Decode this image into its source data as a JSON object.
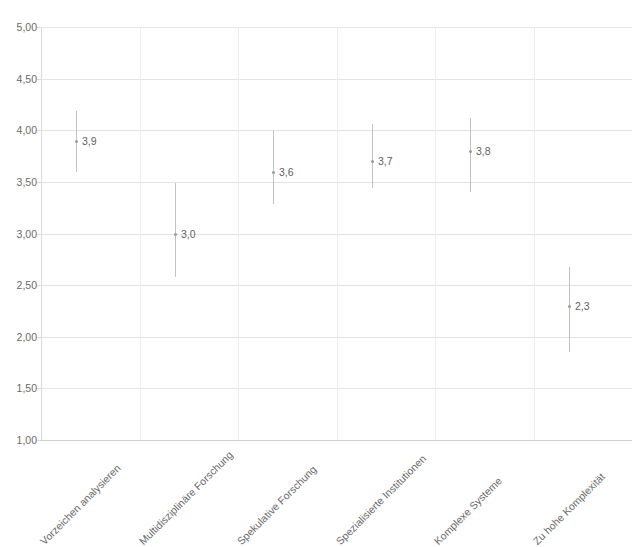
{
  "chart_data": {
    "type": "scatter",
    "title": "",
    "xlabel": "",
    "ylabel": "",
    "ylim": [
      1.0,
      5.0
    ],
    "ytick_step": 0.5,
    "grid": true,
    "legend": false,
    "decimal_separator": ",",
    "categories": [
      "Vorzeichen analysieren",
      "Multidisziplinäre Forschung",
      "Spekulative Forschung",
      "Spezialisierte Institutionen",
      "Komplexe Systeme",
      "Zu hohe Komplexität"
    ],
    "values": [
      3.9,
      3.0,
      3.6,
      3.7,
      3.8,
      2.3
    ],
    "value_labels": [
      "3,9",
      "3,0",
      "3,6",
      "3,7",
      "3,8",
      "2,3"
    ],
    "error_low": [
      3.6,
      2.58,
      3.29,
      3.44,
      3.4,
      1.85
    ],
    "error_high": [
      4.19,
      3.49,
      4.0,
      4.06,
      4.12,
      2.68
    ],
    "ytick_labels": [
      "5,00",
      "4,50",
      "4,00",
      "3,50",
      "3,00",
      "2,50",
      "2,00",
      "1,50",
      "1,00"
    ],
    "ytick_values": [
      5.0,
      4.5,
      4.0,
      3.5,
      3.0,
      2.5,
      2.0,
      1.5,
      1.0
    ]
  },
  "colors": {
    "grid": "#e4e4e4",
    "axis": "#d9d9d9",
    "errorbar": "#c2c2c2",
    "marker": "#9a9a9a",
    "text": "#6a6a6a"
  }
}
